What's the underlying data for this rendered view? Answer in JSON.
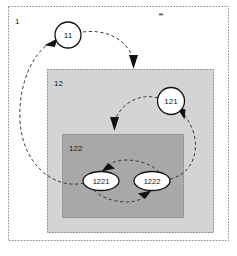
{
  "figure": {
    "background_color": "#ffffff",
    "line_color": "#3a3a3a",
    "border_color": "#8a8a8a"
  },
  "containers": [
    {
      "id": "outer",
      "label": "1",
      "fill": "#ffffff",
      "border_style": "dashed",
      "x": 8,
      "y": 6,
      "width": 221,
      "height": 235
    },
    {
      "id": "mid",
      "label": "12",
      "fill": "#d4d4d4",
      "border_style": "dashed",
      "x": 47,
      "y": 69,
      "width": 167,
      "height": 164
    },
    {
      "id": "inner",
      "label": "122",
      "fill": "#a8a8a8",
      "border_style": "dashed",
      "x": 62,
      "y": 134,
      "width": 122,
      "height": 84
    }
  ],
  "nodes": [
    {
      "id": "n11",
      "label": "11",
      "shape": "circle",
      "cx": 68,
      "cy": 35,
      "rx": 13,
      "ry": 13
    },
    {
      "id": "n121",
      "label": "121",
      "shape": "circle",
      "cx": 171,
      "cy": 101,
      "rx": 13.5,
      "ry": 13.5
    },
    {
      "id": "n1221",
      "label": "1221",
      "shape": "ellipse",
      "cx": 101,
      "cy": 181,
      "rx": 18,
      "ry": 9.5
    },
    {
      "id": "n1222",
      "label": "1222",
      "shape": "ellipse",
      "cx": 152,
      "cy": 181,
      "rx": 18,
      "ry": 9.5
    }
  ],
  "connections": [
    {
      "id": "c-1221-to-11",
      "from": "1221",
      "to": "11",
      "style": "dashed-curve"
    },
    {
      "id": "c-11-to-12",
      "from": "11",
      "to": "12",
      "style": "dashed-curve"
    },
    {
      "id": "c-121-to-122",
      "from": "121",
      "to": "122",
      "style": "dashed-curve"
    },
    {
      "id": "c-1222-to-121",
      "from": "1222",
      "to": "121",
      "style": "dashed-curve"
    },
    {
      "id": "c-1221-to-1222",
      "from": "1221",
      "to": "1222",
      "style": "dashed-curve"
    },
    {
      "id": "c-1222-to-1221",
      "from": "1222",
      "to": "1221",
      "style": "dashed-curve"
    }
  ],
  "marks": [
    {
      "id": "top-tick",
      "x": 159,
      "y": 14,
      "width": 4,
      "height": 2
    }
  ]
}
